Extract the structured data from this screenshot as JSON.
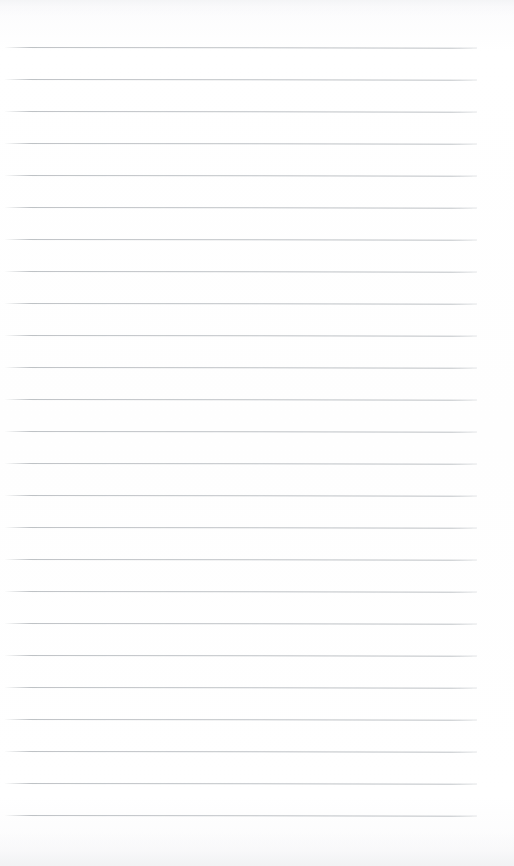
{
  "page": {
    "kind": "scanned-lined-notebook-page",
    "width": 514,
    "height": 866,
    "background_color": "#fdfdfd",
    "has_text": false,
    "has_margin_rule": false,
    "content_text": ""
  },
  "ruling": {
    "line_count": 25,
    "line_color": "#b9bdc1",
    "line_thickness_px": 1,
    "line_spacing_px": 32,
    "first_line_y": 47,
    "last_line_y": 815,
    "line_start_x": 5,
    "line_end_x": 477,
    "skew_degrees": 0.085,
    "lines": [
      {
        "index": 1,
        "y": 47
      },
      {
        "index": 2,
        "y": 79
      },
      {
        "index": 3,
        "y": 111
      },
      {
        "index": 4,
        "y": 143
      },
      {
        "index": 5,
        "y": 175
      },
      {
        "index": 6,
        "y": 207
      },
      {
        "index": 7,
        "y": 239
      },
      {
        "index": 8,
        "y": 271
      },
      {
        "index": 9,
        "y": 303
      },
      {
        "index": 10,
        "y": 335
      },
      {
        "index": 11,
        "y": 367
      },
      {
        "index": 12,
        "y": 399
      },
      {
        "index": 13,
        "y": 431
      },
      {
        "index": 14,
        "y": 463
      },
      {
        "index": 15,
        "y": 495
      },
      {
        "index": 16,
        "y": 527
      },
      {
        "index": 17,
        "y": 559
      },
      {
        "index": 18,
        "y": 591
      },
      {
        "index": 19,
        "y": 623
      },
      {
        "index": 20,
        "y": 655
      },
      {
        "index": 21,
        "y": 687
      },
      {
        "index": 22,
        "y": 719
      },
      {
        "index": 23,
        "y": 751
      },
      {
        "index": 24,
        "y": 783
      },
      {
        "index": 25,
        "y": 815
      }
    ]
  },
  "margins": {
    "top_blank_px": 47,
    "bottom_blank_px": 51,
    "left_blank_px": 5,
    "right_blank_px": 37
  }
}
